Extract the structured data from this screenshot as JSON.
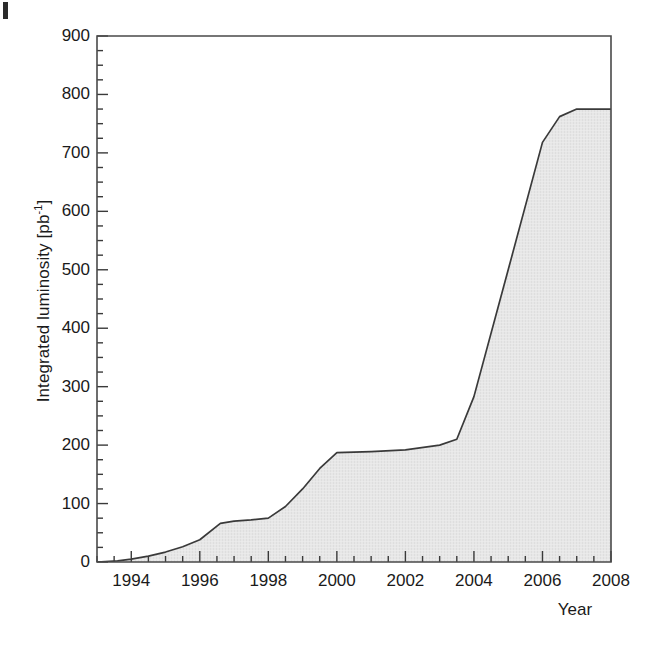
{
  "figure": {
    "kind": "scientific-plot",
    "background": "#ffffff",
    "line_color": "#333333",
    "fill_color": "#e6e6e6",
    "axis_color": "#4a4a4a"
  },
  "chart_data": {
    "type": "area",
    "title": "",
    "xlabel": "Year",
    "ylabel": "Integrated luminosity [pb-1]",
    "ylabel_base": "Integrated luminosity [pb",
    "ylabel_exponent": "-1",
    "ylabel_suffix": "]",
    "xlim": [
      1993,
      2008
    ],
    "ylim": [
      0,
      900
    ],
    "grid": false,
    "legend": null,
    "y_major_ticks": [
      0,
      100,
      200,
      300,
      400,
      500,
      600,
      700,
      800,
      900
    ],
    "y_tick_labels": [
      "0",
      "100",
      "200",
      "300",
      "400",
      "500",
      "600",
      "700",
      "800",
      "900"
    ],
    "y_minor_interval": 25,
    "x_major_ticks": [
      1994,
      1996,
      1998,
      2000,
      2002,
      2004,
      2006,
      2008
    ],
    "x_tick_labels": [
      "1994",
      "1996",
      "1998",
      "2000",
      "2002",
      "2004",
      "2006",
      "2008"
    ],
    "x_minor_interval": 0.5,
    "x": [
      1993.0,
      1993.6,
      1994.0,
      1994.5,
      1995.0,
      1995.5,
      1996.0,
      1996.6,
      1997.0,
      1997.5,
      1998.0,
      1998.5,
      1999.0,
      1999.5,
      2000.0,
      2001.0,
      2002.0,
      2003.0,
      2003.5,
      2004.0,
      2005.0,
      2006.0,
      2006.5,
      2007.0,
      2008.0
    ],
    "values": [
      0,
      2,
      5,
      10,
      17,
      26,
      38,
      66,
      70,
      72,
      75,
      95,
      125,
      160,
      187,
      189,
      192,
      200,
      210,
      283,
      500,
      718,
      762,
      775,
      775
    ],
    "annotations": []
  }
}
